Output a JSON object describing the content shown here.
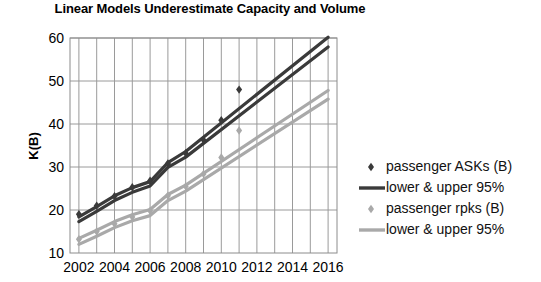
{
  "chart_data": {
    "type": "line",
    "title": "Linear Models Underestimate Capacity and Volume",
    "xlabel": "",
    "ylabel": "K(B)",
    "xlim": [
      2001.5,
      2016.5
    ],
    "ylim": [
      10,
      60
    ],
    "grid": true,
    "x_ticks": [
      "2002",
      "2004",
      "2006",
      "2008",
      "2010",
      "2012",
      "2014",
      "2016"
    ],
    "x_tick_values": [
      2002,
      2004,
      2006,
      2008,
      2010,
      2012,
      2014,
      2016
    ],
    "y_ticks": [
      "10",
      "20",
      "30",
      "40",
      "50",
      "60"
    ],
    "y_tick_values": [
      10,
      20,
      30,
      40,
      50,
      60
    ],
    "legend_position": "right",
    "colors": {
      "dark": "#3a3a3a",
      "light": "#a9a9a9",
      "grid": "#9a9a9a",
      "axis": "#7a7a7a",
      "text": "#000000"
    },
    "series": [
      {
        "name": "passenger ASKs (B)",
        "type": "scatter",
        "marker": "diamond",
        "color": "#3a3a3a",
        "x": [
          2002,
          2003,
          2004,
          2005,
          2006,
          2007,
          2008,
          2009,
          2010,
          2011
        ],
        "values": [
          19.0,
          21.0,
          23.2,
          25.3,
          26.8,
          30.8,
          33.2,
          36.3,
          40.9,
          48.0
        ]
      },
      {
        "name": "lower & upper 95%",
        "type": "line",
        "color": "#3a3a3a",
        "bands": [
          {
            "label": "upper",
            "x": [
              2002,
              2003,
              2004,
              2005,
              2006,
              2007,
              2008,
              2016
            ],
            "values": [
              18.4,
              20.8,
              23.3,
              25.2,
              26.6,
              31.0,
              33.6,
              60.2
            ]
          },
          {
            "label": "lower",
            "x": [
              2002,
              2003,
              2004,
              2005,
              2006,
              2007,
              2008,
              2016
            ],
            "values": [
              17.3,
              19.7,
              22.2,
              24.1,
              25.6,
              29.9,
              32.3,
              57.9
            ]
          }
        ]
      },
      {
        "name": "passenger rpks (B)",
        "type": "scatter",
        "marker": "diamond",
        "color": "#a9a9a9",
        "x": [
          2002,
          2003,
          2004,
          2005,
          2006,
          2007,
          2008,
          2009,
          2010,
          2011
        ],
        "values": [
          13.2,
          15.0,
          16.8,
          18.4,
          19.8,
          23.3,
          25.5,
          28.4,
          32.2,
          38.5
        ]
      },
      {
        "name": "lower & upper 95%",
        "type": "line",
        "color": "#a9a9a9",
        "bands": [
          {
            "label": "upper",
            "x": [
              2002,
              2003,
              2004,
              2005,
              2006,
              2007,
              2008,
              2016
            ],
            "values": [
              13.4,
              15.3,
              17.3,
              18.9,
              20.1,
              23.6,
              25.8,
              47.8
            ]
          },
          {
            "label": "lower",
            "x": [
              2002,
              2003,
              2004,
              2005,
              2006,
              2007,
              2008,
              2016
            ],
            "values": [
              12.0,
              13.9,
              15.9,
              17.5,
              18.7,
              22.2,
              24.4,
              45.8
            ]
          }
        ]
      }
    ],
    "legend": [
      {
        "label": "passenger ASKs (B)",
        "style": "marker",
        "color": "#3a3a3a"
      },
      {
        "label": "lower & upper 95%",
        "style": "line",
        "color": "#3a3a3a"
      },
      {
        "label": "passenger rpks (B)",
        "style": "marker",
        "color": "#a9a9a9"
      },
      {
        "label": "lower & upper 95%",
        "style": "line",
        "color": "#a9a9a9"
      }
    ]
  }
}
